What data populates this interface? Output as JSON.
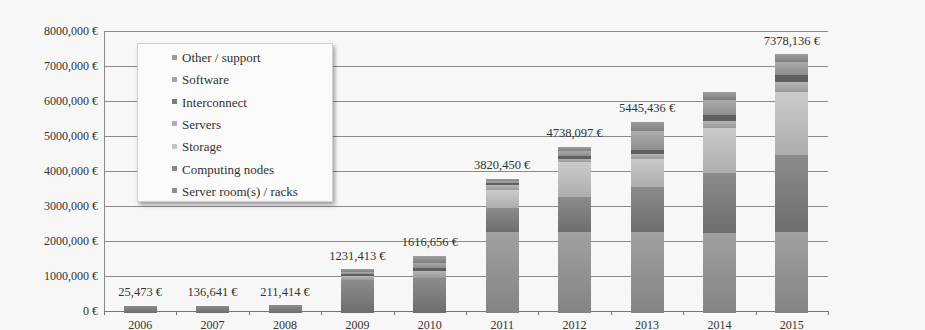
{
  "chart_data": {
    "type": "bar",
    "stacked": true,
    "title": "",
    "xlabel": "",
    "ylabel": "",
    "ylim": [
      0,
      8000000
    ],
    "y_ticks": [
      "0 €",
      "1000,000 €",
      "2000,000 €",
      "3000,000 €",
      "4000,000 €",
      "5000,000 €",
      "6000,000 €",
      "7000,000 €",
      "8000,000 €"
    ],
    "grid": true,
    "legend_position": "upper-left-inside",
    "categories": [
      "2006",
      "2007",
      "2008",
      "2009",
      "2010",
      "2011",
      "2012",
      "2013",
      "2014",
      "2015"
    ],
    "totals": [
      25473,
      136641,
      211414,
      1231413,
      1616656,
      3820450,
      4738097,
      5445436,
      6300000,
      7378136
    ],
    "total_labels": [
      "25,473 €",
      "136,641 €",
      "211,414 €",
      "1231,413 €",
      "1616,656 €",
      "3820,450 €",
      "4738,097 €",
      "5445,436 €",
      "",
      "7378,136 €"
    ],
    "series": [
      {
        "name": "Server room(s) / racks",
        "color": "#8f8f8f",
        "values": [
          0,
          0,
          0,
          0,
          0,
          2300000,
          2300000,
          2300000,
          2300000,
          2300000
        ]
      },
      {
        "name": "Computing nodes",
        "color": "#7a7a7a",
        "values": [
          25473,
          136641,
          211414,
          950000,
          1000000,
          700000,
          1000000,
          1300000,
          1700000,
          2200000
        ]
      },
      {
        "name": "Storage",
        "color": "#b9b9b9",
        "values": [
          0,
          0,
          0,
          0,
          0,
          500000,
          1000000,
          800000,
          1300000,
          1800000
        ]
      },
      {
        "name": "Servers",
        "color": "#a6a6a6",
        "values": [
          0,
          0,
          0,
          100000,
          200000,
          150000,
          100000,
          150000,
          200000,
          300000
        ]
      },
      {
        "name": "Interconnect",
        "color": "#6e6e6e",
        "values": [
          0,
          0,
          0,
          60000,
          90000,
          70000,
          90000,
          100000,
          150000,
          200000
        ]
      },
      {
        "name": "Software",
        "color": "#9a9a9a",
        "values": [
          0,
          0,
          0,
          60000,
          150000,
          50000,
          148097,
          545436,
          450000,
          378136
        ],
        "note": "residual estimate"
      },
      {
        "name": "Other / support",
        "color": "#8c8c8c",
        "values": [
          0,
          0,
          0,
          61413,
          176656,
          50450,
          100000,
          250000,
          200000,
          200000
        ]
      }
    ]
  },
  "legend": {
    "items": [
      {
        "label": "Other / support",
        "color": "#9d9d9d"
      },
      {
        "label": "Software",
        "color": "#a5a5a5"
      },
      {
        "label": "Interconnect",
        "color": "#7b7b7b"
      },
      {
        "label": "Servers",
        "color": "#b0b0b0"
      },
      {
        "label": "Storage",
        "color": "#c4c4c4"
      },
      {
        "label": "Computing nodes",
        "color": "#8a8a8a"
      },
      {
        "label": "Server room(s) / racks",
        "color": "#8e8e8e"
      }
    ]
  }
}
